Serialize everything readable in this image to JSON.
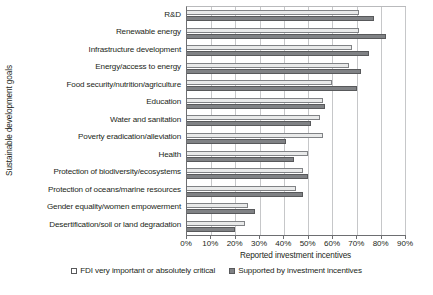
{
  "chart_data": {
    "type": "bar",
    "orientation": "horizontal",
    "title": "",
    "xlabel": "Reported investment incentives",
    "ylabel": "Sustainable development goals",
    "xlim": [
      0,
      90
    ],
    "xticks": [
      0,
      10,
      20,
      30,
      40,
      50,
      60,
      70,
      80,
      90
    ],
    "xtick_labels": [
      "0%",
      "10%",
      "20%",
      "30%",
      "40%",
      "50%",
      "60%",
      "70%",
      "80%",
      "90%"
    ],
    "grid": "vertical",
    "legend_position": "bottom",
    "categories": [
      "R&D",
      "Renewable energy",
      "Infrastructure development",
      "Energy/access to energy",
      "Food security/nutrition/agriculture",
      "Education",
      "Water and sanitation",
      "Poverty eradication/alleviation",
      "Health",
      "Protection of biodiversity/ecosystems",
      "Protection of oceans/marine resources",
      "Gender equality/women empowerment",
      "Desertification/soil or land degradation"
    ],
    "series": [
      {
        "name": "FDI very important or absolutely critical",
        "swatch": "light",
        "values": [
          71,
          71,
          68,
          67,
          60,
          56,
          55,
          56,
          50,
          48,
          45,
          25,
          24
        ]
      },
      {
        "name": "Supported by investment incentives",
        "swatch": "dark",
        "values": [
          77,
          82,
          75,
          72,
          70,
          57,
          51,
          41,
          44,
          50,
          48,
          28,
          20
        ]
      }
    ]
  },
  "legend": {
    "items": [
      {
        "label": "FDI very important or absolutely critical",
        "swatch": "light"
      },
      {
        "label": "Supported by investment incentives",
        "swatch": "dark"
      }
    ]
  }
}
